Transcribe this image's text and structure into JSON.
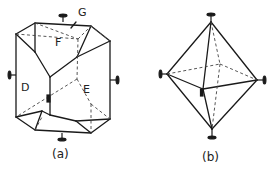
{
  "figure_a": {
    "caption": "(a)",
    "face_labels": {
      "G": "G",
      "F": "F",
      "D": "D",
      "E": "E"
    }
  },
  "figure_b": {
    "caption": "(b)"
  },
  "colors": {
    "line": "#1a1a1a",
    "background": "#ffffff"
  }
}
